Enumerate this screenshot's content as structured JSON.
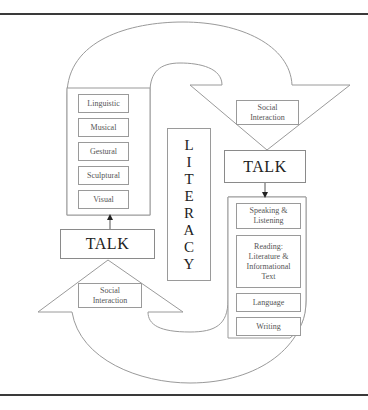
{
  "diagram": {
    "title": "",
    "center_label": "LITERACY",
    "center_letters": [
      "L",
      "I",
      "T",
      "E",
      "R",
      "A",
      "C",
      "Y"
    ],
    "left_cycle": {
      "modes": [
        "Linguistic",
        "Musical",
        "Gestural",
        "Sculptural",
        "Visual"
      ],
      "talk_label": "TALK",
      "social_label_line1": "Social",
      "social_label_line2": "Interaction"
    },
    "right_cycle": {
      "social_label_line1": "Social",
      "social_label_line2": "Interaction",
      "talk_label": "TALK",
      "strands": [
        {
          "lines": [
            "Speaking &",
            "Listening"
          ]
        },
        {
          "lines": [
            "Reading:",
            "Literature &",
            "Informational",
            "Text"
          ]
        },
        {
          "lines": [
            "Language"
          ]
        },
        {
          "lines": [
            "Writing"
          ]
        }
      ]
    },
    "colors": {
      "outline": "#9a9a9a",
      "rule": "#3a3a3a",
      "text": "#333333"
    }
  }
}
